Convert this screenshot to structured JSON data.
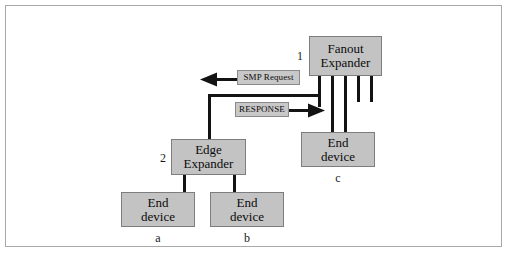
{
  "diagram": {
    "colors": {
      "node_fill": "#c3c3c3",
      "node_stroke": "#7d7d7d",
      "label_fill": "#c8c8c8",
      "wire": "#131313",
      "frame": "#a8a8a8",
      "background": "#ffffff"
    },
    "nodes": {
      "fanout_expander": {
        "line1": "Fanout",
        "line2": "Expander",
        "tag": "1"
      },
      "edge_expander": {
        "line1": "Edge",
        "line2": "Expander",
        "tag": "2"
      },
      "end_device_a": {
        "line1": "End",
        "line2": "device",
        "tag": "a"
      },
      "end_device_b": {
        "line1": "End",
        "line2": "device",
        "tag": "b"
      },
      "end_device_c": {
        "line1": "End",
        "line2": "device",
        "tag": "c"
      }
    },
    "messages": {
      "smp_request": {
        "label": "SMP Request",
        "direction": "left"
      },
      "response": {
        "label": "RESPONSE",
        "direction": "right"
      }
    }
  }
}
